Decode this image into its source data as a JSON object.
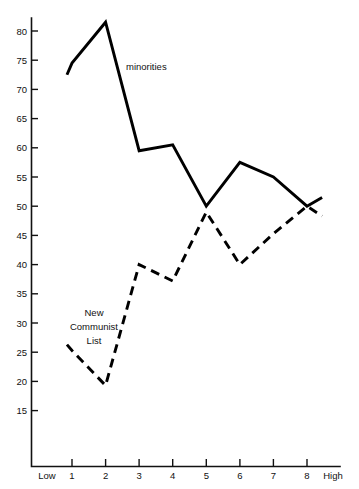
{
  "chart_data": {
    "type": "line",
    "title": "",
    "subtitle": "",
    "xlabel": "",
    "ylabel": "",
    "grid": false,
    "legend_position": "inline-annotation",
    "x": [
      1,
      2,
      3,
      4,
      5,
      6,
      7,
      8
    ],
    "categories": [
      "1",
      "2",
      "3",
      "4",
      "5",
      "6",
      "7",
      "8"
    ],
    "xlim": [
      1,
      8
    ],
    "ylim": [
      15,
      82
    ],
    "x_axis_low_label": "Low",
    "x_axis_high_label": "High",
    "x_tick_labels": [
      "1",
      "2",
      "3",
      "4",
      "5",
      "6",
      "7",
      "8"
    ],
    "y_tick_labels": [
      "80",
      "75",
      "70",
      "65",
      "60",
      "55",
      "50",
      "45",
      "40",
      "35",
      "30",
      "25",
      "20",
      "15"
    ],
    "y_ticks": [
      80,
      75,
      70,
      65,
      60,
      55,
      50,
      45,
      40,
      35,
      30,
      25,
      20,
      15
    ],
    "series": [
      {
        "name": "minorities",
        "style": "solid",
        "color": "#000000",
        "values": [
          74.5,
          81.5,
          59.5,
          60.5,
          50.0,
          57.5,
          55.0,
          50.0
        ],
        "lead_in": {
          "x": 0.85,
          "y": 72.5
        },
        "lead_out": {
          "x": 8.45,
          "y": 51.5
        }
      },
      {
        "name": "New Communist List",
        "style": "dashed",
        "color": "#000000",
        "values": [
          25.3,
          19.3,
          40.0,
          37.2,
          49.0,
          40.0,
          45.3,
          50.0
        ],
        "lead_in": {
          "x": 0.85,
          "y": 26.3
        },
        "lead_out": {
          "x": 8.45,
          "y": 48.3
        }
      }
    ],
    "annotations": [
      {
        "text": "minorities",
        "series": "minorities",
        "x_px": 126,
        "y_px": 70
      },
      {
        "text_lines": [
          "New",
          "Communist",
          "List"
        ],
        "series": "New Communist List",
        "x_px": 94,
        "y_px": 316
      }
    ]
  },
  "labels": {
    "minorities": "minorities",
    "ncl_line1": "New",
    "ncl_line2": "Communist",
    "ncl_line3": "List",
    "low": "Low",
    "high": "High"
  },
  "y_axis": {
    "t80": "80",
    "t75": "75",
    "t70": "70",
    "t65": "65",
    "t60": "60",
    "t55": "55",
    "t50": "50",
    "t45": "45",
    "t40": "40",
    "t35": "35",
    "t30": "30",
    "t25": "25",
    "t20": "20",
    "t15": "15"
  },
  "x_axis": {
    "t1": "1",
    "t2": "2",
    "t3": "3",
    "t4": "4",
    "t5": "5",
    "t6": "6",
    "t7": "7",
    "t8": "8"
  },
  "colors": {
    "ink": "#000000",
    "background": "#ffffff"
  }
}
